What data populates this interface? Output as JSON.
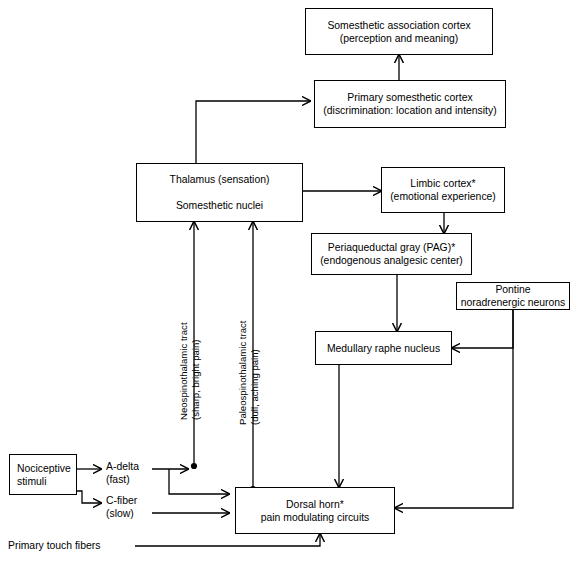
{
  "diagram": {
    "stroke_color": "#000000",
    "background_color": "#ffffff",
    "nodes": [
      {
        "id": "somesthetic-association-cortex",
        "lines": [
          "Somesthetic association cortex",
          "(perception and meaning)"
        ]
      },
      {
        "id": "primary-somesthetic-cortex",
        "lines": [
          "Primary somesthetic cortex",
          "(discrimination: location and intensity)"
        ]
      },
      {
        "id": "thalamus",
        "lines": [
          "Thalamus (sensation)",
          "Somesthetic nuclei"
        ]
      },
      {
        "id": "limbic-cortex",
        "lines": [
          "Limbic cortex*",
          "(emotional experience)"
        ]
      },
      {
        "id": "periaqueductal-gray",
        "lines": [
          "Periaqueductal gray (PAG)*",
          "(endogenous analgesic center)"
        ]
      },
      {
        "id": "pontine-noradrenergic-neurons",
        "lines": [
          "Pontine",
          "noradrenergic neurons"
        ]
      },
      {
        "id": "medullary-raphe-nucleus",
        "lines": [
          "Medullary raphe nucleus"
        ]
      },
      {
        "id": "dorsal-horn",
        "lines": [
          "Dorsal horn*",
          "pain modulating circuits"
        ]
      },
      {
        "id": "nociceptive-stimuli",
        "lines": [
          "Nociceptive",
          "stimuli"
        ]
      }
    ],
    "labels": [
      {
        "id": "a-delta-fiber",
        "lines": [
          "A-delta",
          "(fast)"
        ]
      },
      {
        "id": "c-fiber",
        "lines": [
          "C-fiber",
          "(slow)"
        ]
      },
      {
        "id": "primary-touch-fibers",
        "lines": [
          "Primary touch fibers"
        ]
      }
    ],
    "tract_labels": [
      {
        "id": "neospinothalamic-tract",
        "lines": [
          "Neospinothalamic tract",
          "(sharp, bright pain)"
        ]
      },
      {
        "id": "paleospinothalamic-tract",
        "lines": [
          "Paleospinothalamic tract",
          "(dull, aching pain)"
        ]
      }
    ]
  }
}
